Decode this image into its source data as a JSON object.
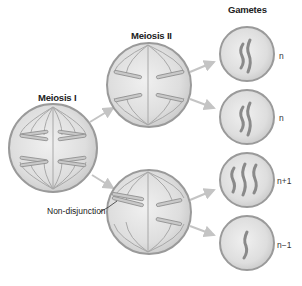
{
  "diagram": {
    "stages": [
      {
        "label": "Meiosis I"
      },
      {
        "label": "Meiosis II"
      },
      {
        "label": "Gametes"
      }
    ],
    "annotation": {
      "label": "Non-disjunction"
    },
    "gametes": [
      {
        "ploidy": "n",
        "chromosome_count": 2
      },
      {
        "ploidy": "n",
        "chromosome_count": 2
      },
      {
        "ploidy": "n+1",
        "chromosome_count": 3
      },
      {
        "ploidy": "n−1",
        "chromosome_count": 1
      }
    ],
    "colors": {
      "cell_fill": "#dcdcdc",
      "cell_stroke": "#9a9a9a",
      "spindle": "#a8a8a8",
      "chromosome_fill": "#c9c9c9",
      "chromosome_stroke": "#8c8c8c",
      "gamete_chromosome": "#8a8a8a",
      "arrow": "#c4c4c4"
    }
  }
}
